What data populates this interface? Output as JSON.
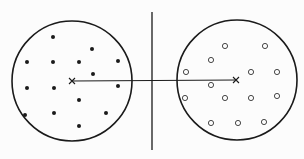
{
  "diagram": {
    "colors": {
      "stroke": "#1a1a1a",
      "background": "#fcfcfc"
    },
    "boundary": {
      "x": 152,
      "y1": 12,
      "y2": 150
    },
    "clusters": [
      {
        "name": "left-cluster",
        "marker": "filled-dot",
        "circle": {
          "cx": 72,
          "cy": 81,
          "r": 60
        },
        "centroid": {
          "x": 72,
          "y": 81
        },
        "points": [
          [
            53,
            37
          ],
          [
            92,
            49
          ],
          [
            27,
            62
          ],
          [
            53,
            62
          ],
          [
            79,
            62
          ],
          [
            118,
            61
          ],
          [
            93,
            74
          ],
          [
            27,
            88
          ],
          [
            54,
            88
          ],
          [
            118,
            86
          ],
          [
            79,
            100
          ],
          [
            25,
            115
          ],
          [
            54,
            113
          ],
          [
            106,
            113
          ],
          [
            79,
            126
          ]
        ]
      },
      {
        "name": "right-cluster",
        "marker": "open-circle",
        "circle": {
          "cx": 237,
          "cy": 80,
          "r": 60
        },
        "centroid": {
          "x": 236,
          "y": 80
        },
        "points": [
          [
            225,
            46
          ],
          [
            265,
            46
          ],
          [
            211,
            60
          ],
          [
            186,
            72
          ],
          [
            251,
            72
          ],
          [
            277,
            72
          ],
          [
            211,
            85
          ],
          [
            185,
            98
          ],
          [
            225,
            98
          ],
          [
            251,
            98
          ],
          [
            277,
            96
          ],
          [
            211,
            123
          ],
          [
            238,
            123
          ],
          [
            264,
            122
          ]
        ]
      }
    ]
  }
}
